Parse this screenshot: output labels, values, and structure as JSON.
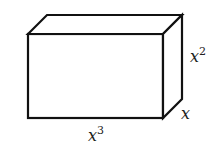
{
  "diagram": {
    "type": "rectangular-prism",
    "stroke_color": "#111111",
    "fill_color": "#ffffff",
    "labels": {
      "length": {
        "base": "x",
        "exponent": "3",
        "text": "x^3"
      },
      "height": {
        "base": "x",
        "exponent": "2",
        "text": "x^2"
      },
      "depth": {
        "base": "x",
        "exponent": "",
        "text": "x"
      }
    }
  }
}
